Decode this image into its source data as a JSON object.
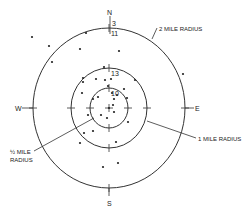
{
  "diagram": {
    "type": "concentric-radius-map",
    "center": {
      "x": 109,
      "y": 108
    },
    "circles": [
      {
        "name": "half-mile",
        "rx": 19,
        "ry": 20
      },
      {
        "name": "one-mile",
        "rx": 38,
        "ry": 40
      },
      {
        "name": "two-mile",
        "rx": 76,
        "ry": 80
      }
    ],
    "directions": {
      "north": "N",
      "south": "S",
      "east": "E",
      "west": "W"
    },
    "labels": {
      "two_mile": "2 MILE RADIUS",
      "one_mile": "1 MILE RADIUS",
      "half_mile_fraction": "½ MILE",
      "half_mile_radius": "RADIUS"
    },
    "counts": {
      "outside_two_mile": "3",
      "two_mile_ring": "11",
      "one_mile_ring": "13",
      "half_mile": "10"
    },
    "points": [
      [
        32,
        37
      ],
      [
        49,
        46
      ],
      [
        52,
        62
      ],
      [
        80,
        49
      ],
      [
        86,
        33
      ],
      [
        119,
        51
      ],
      [
        183,
        74
      ],
      [
        104,
        67
      ],
      [
        83,
        78
      ],
      [
        83,
        82
      ],
      [
        96,
        79
      ],
      [
        105,
        80
      ],
      [
        111,
        79
      ],
      [
        135,
        80
      ],
      [
        82,
        93
      ],
      [
        108,
        86
      ],
      [
        124,
        89
      ],
      [
        112,
        93
      ],
      [
        98,
        97
      ],
      [
        93,
        99
      ],
      [
        127,
        98
      ],
      [
        117,
        95
      ],
      [
        114,
        99
      ],
      [
        109,
        108
      ],
      [
        113,
        105
      ],
      [
        88,
        115
      ],
      [
        101,
        115
      ],
      [
        107,
        118
      ],
      [
        114,
        112
      ],
      [
        128,
        122
      ],
      [
        93,
        131
      ],
      [
        84,
        133
      ],
      [
        80,
        143
      ],
      [
        116,
        142
      ],
      [
        103,
        167
      ],
      [
        118,
        163
      ]
    ]
  }
}
